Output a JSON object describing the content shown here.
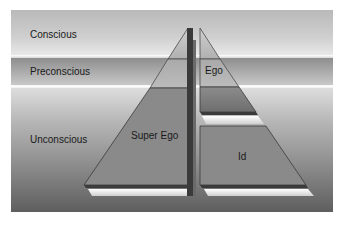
{
  "diagram": {
    "levels": [
      {
        "id": "conscious",
        "label": "Conscious"
      },
      {
        "id": "preconscious",
        "label": "Preconscious"
      },
      {
        "id": "unconscious",
        "label": "Unconscious"
      }
    ],
    "structures": [
      {
        "id": "super-ego",
        "label": "Super Ego"
      },
      {
        "id": "ego",
        "label": "Ego"
      },
      {
        "id": "id",
        "label": "Id"
      }
    ],
    "colors": {
      "pyramid_fill": "#8a8a8a",
      "pyramid_top_fill": "#bdbdbd",
      "pyramid_edge": "#3a3a3a",
      "ledge_highlight": "#f2f2f2"
    }
  }
}
